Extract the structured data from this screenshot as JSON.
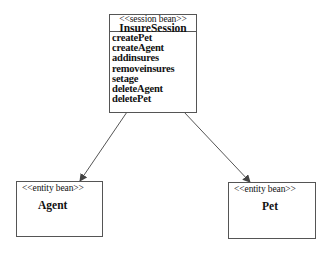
{
  "diagram": {
    "type": "uml-class-diagram",
    "session_bean": {
      "stereotype": "<<session bean>>",
      "name": "InsureSession",
      "operations": [
        "createPet",
        "createAgent",
        "addinsures",
        "removeinsures",
        "setage",
        "deleteAgent",
        "deletePet"
      ]
    },
    "entity_beans": [
      {
        "stereotype": "<<entity bean>>",
        "name": "Agent"
      },
      {
        "stereotype": "<<entity bean>>",
        "name": "Pet"
      }
    ],
    "associations": [
      {
        "from": "InsureSession",
        "to": "Agent",
        "style": "directed-arrow"
      },
      {
        "from": "InsureSession",
        "to": "Pet",
        "style": "directed-arrow"
      }
    ],
    "colors": {
      "line": "#555555",
      "text": "#111111",
      "background": "#ffffff"
    }
  }
}
